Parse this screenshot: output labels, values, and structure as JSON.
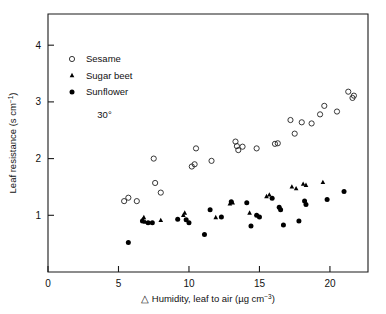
{
  "chart_data": {
    "type": "scatter",
    "title": "",
    "xlabel": "△ Humidity, leaf to air (µg cm⁻³)",
    "ylabel": "Leaf resistance (s cm⁻¹)",
    "xlim": [
      0,
      22.7
    ],
    "ylim": [
      0,
      4.55
    ],
    "xticks": [
      0,
      5,
      10,
      15,
      20
    ],
    "yticks": [
      1,
      2,
      3,
      4
    ],
    "xtick_labels": [
      "0",
      "5",
      "10",
      "15",
      "20"
    ],
    "ytick_labels": [
      "1",
      "2",
      "3",
      "4"
    ],
    "grid": false,
    "legend_position": "upper-left-inside",
    "annotations": [
      {
        "text": "30°",
        "x": 3.5,
        "y": 2.72
      }
    ],
    "series": [
      {
        "name": "Sesame",
        "marker": "open-circle",
        "color": "#222222",
        "points": [
          [
            5.4,
            1.25
          ],
          [
            5.7,
            1.31
          ],
          [
            6.3,
            1.25
          ],
          [
            7.5,
            2.0
          ],
          [
            7.6,
            1.57
          ],
          [
            8.0,
            1.4
          ],
          [
            10.2,
            1.86
          ],
          [
            10.4,
            1.9
          ],
          [
            10.5,
            2.18
          ],
          [
            11.6,
            1.96
          ],
          [
            13.3,
            2.3
          ],
          [
            13.4,
            2.22
          ],
          [
            13.5,
            2.15
          ],
          [
            13.8,
            2.21
          ],
          [
            14.8,
            2.18
          ],
          [
            16.1,
            2.26
          ],
          [
            16.3,
            2.27
          ],
          [
            17.2,
            2.68
          ],
          [
            17.5,
            2.44
          ],
          [
            18.0,
            2.64
          ],
          [
            18.7,
            2.62
          ],
          [
            19.3,
            2.78
          ],
          [
            19.6,
            2.93
          ],
          [
            20.5,
            2.83
          ],
          [
            21.3,
            3.18
          ],
          [
            21.6,
            3.07
          ],
          [
            21.7,
            3.11
          ]
        ]
      },
      {
        "name": "Sugar beet",
        "marker": "filled-triangle",
        "color": "#000000",
        "points": [
          [
            6.7,
            0.92
          ],
          [
            6.8,
            0.96
          ],
          [
            6.9,
            0.88
          ],
          [
            8.0,
            0.91
          ],
          [
            9.6,
            1.0
          ],
          [
            9.7,
            1.04
          ],
          [
            11.9,
            0.96
          ],
          [
            12.9,
            1.2
          ],
          [
            13.1,
            1.22
          ],
          [
            14.3,
            1.04
          ],
          [
            15.5,
            1.33
          ],
          [
            15.7,
            1.36
          ],
          [
            17.3,
            1.5
          ],
          [
            17.6,
            1.47
          ],
          [
            18.1,
            1.55
          ],
          [
            18.3,
            1.53
          ],
          [
            19.5,
            1.58
          ]
        ]
      },
      {
        "name": "Sunflower",
        "marker": "filled-circle",
        "color": "#000000",
        "points": [
          [
            5.7,
            0.52
          ],
          [
            6.7,
            0.9
          ],
          [
            7.1,
            0.87
          ],
          [
            7.4,
            0.87
          ],
          [
            9.2,
            0.93
          ],
          [
            9.8,
            0.92
          ],
          [
            10.0,
            0.87
          ],
          [
            11.1,
            0.66
          ],
          [
            11.5,
            1.1
          ],
          [
            12.3,
            0.97
          ],
          [
            13.0,
            1.24
          ],
          [
            14.1,
            1.22
          ],
          [
            14.4,
            0.81
          ],
          [
            14.8,
            1.0
          ],
          [
            15.0,
            0.97
          ],
          [
            15.9,
            1.3
          ],
          [
            16.4,
            1.14
          ],
          [
            16.5,
            1.1
          ],
          [
            16.7,
            0.83
          ],
          [
            17.8,
            0.9
          ],
          [
            18.2,
            1.25
          ],
          [
            18.3,
            1.19
          ],
          [
            19.8,
            1.28
          ],
          [
            21.0,
            1.42
          ]
        ]
      }
    ]
  },
  "legend": {
    "items": [
      {
        "label": "Sesame",
        "marker": "open-circle"
      },
      {
        "label": "Sugar beet",
        "marker": "filled-triangle"
      },
      {
        "label": "Sunflower",
        "marker": "filled-circle"
      }
    ]
  },
  "axes": {
    "y_title_main": "Leaf resistance (s cm",
    "y_title_sup": "−1",
    "y_title_tail": ")",
    "x_title_prefix": "△ Humidity, leaf to air (µg cm",
    "x_title_sup": "−3",
    "x_title_tail": ")"
  }
}
